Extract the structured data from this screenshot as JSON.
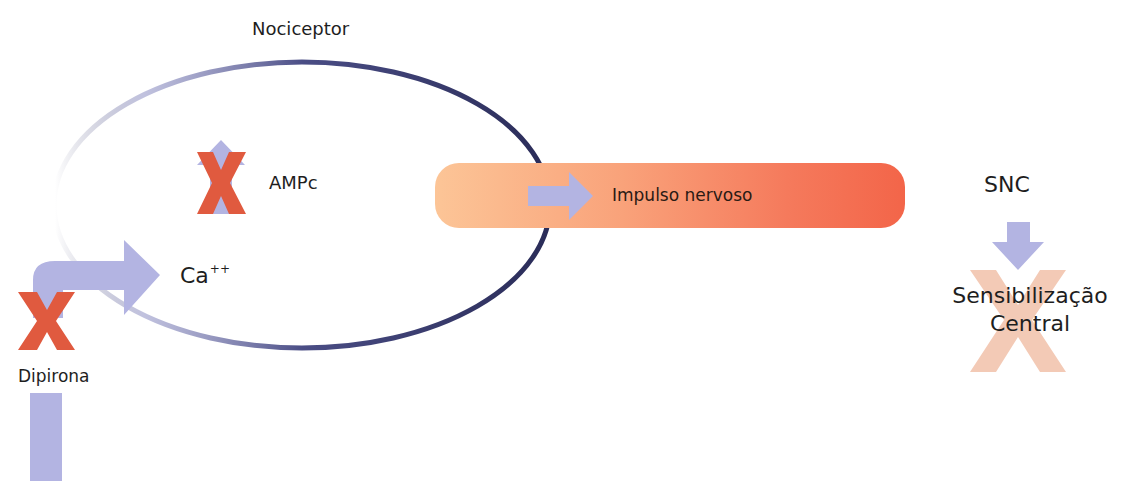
{
  "diagram": {
    "nociceptor": {
      "label": "Nociceptor",
      "stroke_color": "#2e3160"
    },
    "ampc": {
      "label": "AMPc",
      "arrow_direction": "up",
      "blocked": true
    },
    "calcium": {
      "label": "Ca",
      "superscript": "++",
      "arrow_direction": "right"
    },
    "drug": {
      "label": "Dipirona",
      "blocked_marker": "X"
    },
    "impulse": {
      "label": "Impulso nervoso",
      "gradient_start": "#fcc597",
      "gradient_end": "#f36549"
    },
    "cns": {
      "label": "SNC",
      "arrow_direction": "down"
    },
    "central_sensitization": {
      "line1": "Sensibilização",
      "line2": "Central",
      "blocked": true
    },
    "colors": {
      "arrow": "#b3b4e2",
      "block_x": "#e05a3f",
      "faded_x": "#f2c4ae",
      "membrane": "#2e3160"
    }
  }
}
